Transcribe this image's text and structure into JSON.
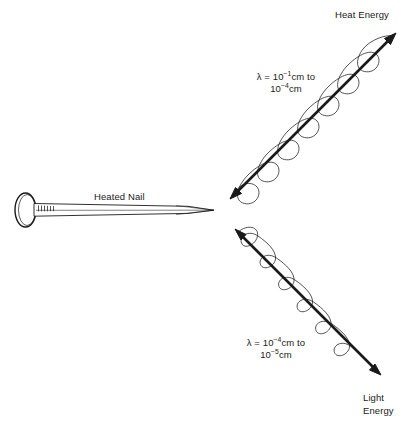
{
  "figure": {
    "background_color": "#ffffff",
    "ink_color": "#1a1a1a"
  },
  "nail": {
    "label": "Heated Nail",
    "orientation": "horizontal, head at left, point at right"
  },
  "waves": [
    {
      "id": "heat",
      "end_label": "Heat Energy",
      "wavelength_label_parts": {
        "lambda": "λ",
        "equals": " = ",
        "from_base": "10",
        "from_exponent": "−1",
        "from_unit": "cm",
        "connector": " to ",
        "to_base": "10",
        "to_exponent": "−4",
        "to_unit": "cm"
      },
      "wavelength_line1": "λ = 10⁻¹cm to",
      "wavelength_line2": "10⁻⁴cm",
      "direction": "up-right",
      "cycles": 4,
      "relative_wavelength": "longer"
    },
    {
      "id": "light",
      "end_label_line1": "Light",
      "end_label_line2": "Energy",
      "wavelength_label_parts": {
        "lambda": "λ",
        "equals": " = ",
        "from_base": "10",
        "from_exponent": "−4",
        "from_unit": "cm",
        "connector": " to ",
        "to_base": "10",
        "to_exponent": "−5",
        "to_unit": "cm"
      },
      "wavelength_line1": "λ = 10⁻⁴cm to",
      "wavelength_line2": "10⁻⁵cm",
      "direction": "down-right",
      "cycles": 5,
      "relative_wavelength": "shorter"
    }
  ]
}
